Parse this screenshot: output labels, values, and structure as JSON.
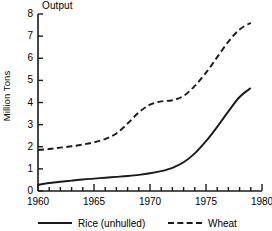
{
  "chart_data": {
    "type": "line",
    "title": "Output",
    "subtitle": "",
    "xlabel": "",
    "ylabel": "Million Tons",
    "xlim": [
      1960,
      1980
    ],
    "ylim": [
      0,
      8
    ],
    "grid": false,
    "legend_position": "bottom",
    "x_ticks_major": [
      "1960",
      "1965",
      "1970",
      "1975",
      "1980"
    ],
    "x_ticks_minor_interval": 1,
    "y_ticks": [
      "0",
      "1",
      "2",
      "3",
      "4",
      "5",
      "6",
      "7",
      "8"
    ],
    "x": [
      1960,
      1961,
      1962,
      1963,
      1964,
      1965,
      1966,
      1967,
      1968,
      1969,
      1970,
      1971,
      1972,
      1973,
      1974,
      1975,
      1976,
      1977,
      1978,
      1979
    ],
    "series": [
      {
        "name": "Rice (unhulled)",
        "style": "solid",
        "color": "#1a1a1a",
        "values": [
          0.28,
          0.36,
          0.42,
          0.47,
          0.52,
          0.56,
          0.6,
          0.64,
          0.68,
          0.73,
          0.8,
          0.9,
          1.05,
          1.3,
          1.7,
          2.25,
          2.9,
          3.6,
          4.25,
          4.65
        ]
      },
      {
        "name": "Wheat",
        "style": "dashed",
        "color": "#1a1a1a",
        "values": [
          1.85,
          1.9,
          1.96,
          2.02,
          2.1,
          2.2,
          2.35,
          2.6,
          3.05,
          3.55,
          3.9,
          4.05,
          4.1,
          4.3,
          4.75,
          5.35,
          6.05,
          6.75,
          7.3,
          7.6
        ]
      }
    ],
    "legend": [
      {
        "label": "Rice (unhulled)",
        "style": "solid"
      },
      {
        "label": "Wheat",
        "style": "dashed"
      }
    ]
  },
  "axes_geometry": {
    "left": 38,
    "right": 262,
    "top": 14,
    "bottom": 191
  }
}
